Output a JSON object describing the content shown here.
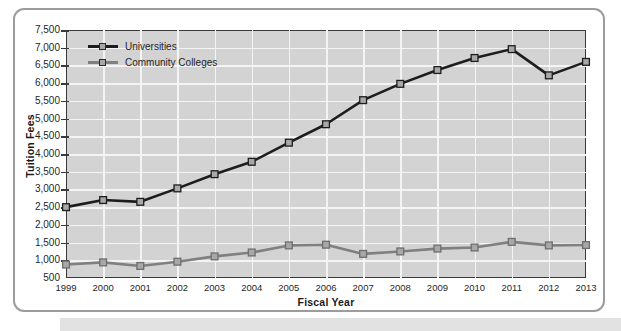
{
  "figure": {
    "background_color": "#ffffff",
    "frame_color": "#9c9c9c",
    "plot_background_color": "#d3d3d3",
    "gridline_color": "#f4f4f4",
    "axis_color": "#3a3a3a"
  },
  "legend": {
    "position": "top-left-inside",
    "entries": [
      {
        "label": "Universities",
        "color": "#1d1d1d"
      },
      {
        "label": "Community Colleges",
        "color": "#808080"
      }
    ]
  },
  "chart_data": {
    "type": "line",
    "title": "",
    "xlabel": "Fiscal Year",
    "ylabel": "Tuition Fees",
    "grid": true,
    "legend_position": "top-left-inside",
    "categories": [
      "1999",
      "2000",
      "2001",
      "2002",
      "2003",
      "2004",
      "2005",
      "2006",
      "2007",
      "2008",
      "2009",
      "2010",
      "2011",
      "2012",
      "2013"
    ],
    "x": [
      1999,
      2000,
      2001,
      2002,
      2003,
      2004,
      2005,
      2006,
      2007,
      2008,
      2009,
      2010,
      2011,
      2012,
      2013
    ],
    "ylim": [
      500,
      7500
    ],
    "ytick_labels": [
      "7,500",
      "7,000",
      "6,500",
      "6,000",
      "5,500",
      "5,000",
      "4,500",
      "4,000",
      "3,500",
      "3,000",
      "2,500",
      "2,000",
      "1,500",
      "1,000",
      "500"
    ],
    "ytick_values": [
      7500,
      7000,
      6500,
      6000,
      5500,
      5000,
      4500,
      4000,
      3500,
      3000,
      2500,
      2000,
      1500,
      1000,
      500
    ],
    "series": [
      {
        "name": "Universities",
        "color": "#1d1d1d",
        "marker": "square",
        "values": [
          2500,
          2700,
          2650,
          3030,
          3430,
          3780,
          4320,
          4840,
          5520,
          5980,
          6370,
          6710,
          6960,
          6220,
          6600
        ]
      },
      {
        "name": "Community Colleges",
        "color": "#808080",
        "marker": "square",
        "values": [
          880,
          940,
          840,
          960,
          1110,
          1220,
          1420,
          1440,
          1180,
          1250,
          1330,
          1360,
          1520,
          1420,
          1430
        ]
      }
    ]
  }
}
